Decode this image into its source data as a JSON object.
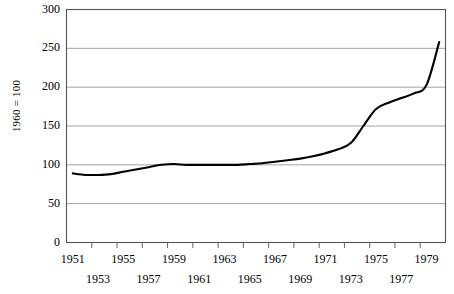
{
  "chart_data": {
    "type": "line",
    "title": "",
    "subtitle": "",
    "xlabel": "",
    "ylabel": "1960 = 100",
    "ylim": [
      0,
      300
    ],
    "xlim": [
      1951,
      1980
    ],
    "grid": "horizontal",
    "legend": "none",
    "y_ticks": [
      0,
      50,
      100,
      150,
      200,
      250,
      300
    ],
    "y_tick_labels": [
      "0",
      "50",
      "100",
      "150",
      "200",
      "250",
      "300"
    ],
    "x_tick_labels_row1": [
      "1951",
      "1955",
      "1959",
      "1963",
      "1967",
      "1971",
      "1975",
      "1979"
    ],
    "x_tick_labels_row2": [
      "1953",
      "1957",
      "1961",
      "1965",
      "1969",
      "1973",
      "1977"
    ],
    "x": [
      1951,
      1952,
      1953,
      1954,
      1955,
      1956,
      1957,
      1958,
      1959,
      1960,
      1961,
      1962,
      1963,
      1964,
      1965,
      1966,
      1967,
      1968,
      1969,
      1970,
      1971,
      1972,
      1973,
      1974,
      1975,
      1976,
      1977,
      1978,
      1979,
      1980
    ],
    "series": [
      {
        "name": "index",
        "values": [
          89,
          87,
          87,
          88,
          91,
          94,
          97,
          100,
          101,
          100,
          100,
          100,
          100,
          100,
          101,
          102,
          104,
          106,
          108,
          111,
          115,
          120,
          128,
          150,
          172,
          180,
          186,
          192,
          203,
          258
        ]
      }
    ],
    "line_color": "#000000",
    "grid_color": "#999999",
    "axis_color": "#555555",
    "background": "#ffffff"
  }
}
